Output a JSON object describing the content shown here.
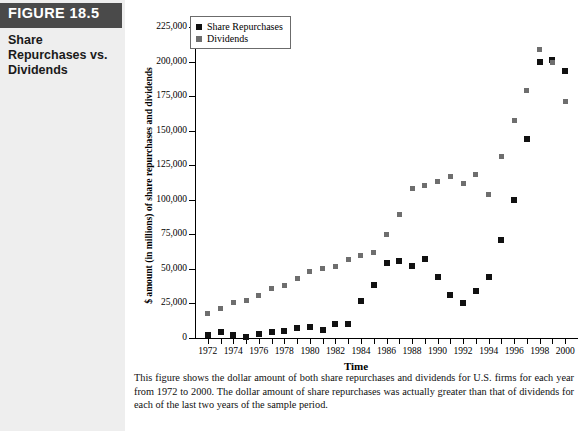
{
  "sidebar": {
    "figure_banner": "FIGURE 18.5",
    "figure_title": "Share Repurchases vs. Dividends"
  },
  "figure": {
    "caption": "This figure shows the dollar amount of both share repurchases and dividends for U.S. firms for each year from 1972 to 2000. The dollar amount of share repurchases was actually greater than that of dividends for each of the last two years of the sample period."
  },
  "colors": {
    "repurchases": "#111111",
    "dividends": "#6e6e6e",
    "banner_bg": "#4a4a4a",
    "sidebar_bg": "#eeeeee"
  },
  "chart_data": {
    "type": "scatter",
    "title": "",
    "xlabel": "Time",
    "ylabel": "$ amount (in millions) of share repurchases and dividends",
    "xlim": [
      1971,
      2001
    ],
    "ylim": [
      0,
      225000
    ],
    "grid": false,
    "legend_position": "top-left",
    "y_ticks": [
      0,
      25000,
      50000,
      75000,
      100000,
      125000,
      150000,
      175000,
      200000,
      225000
    ],
    "y_tick_labels": [
      "0",
      "25,000",
      "50,000",
      "75,000",
      "100,000",
      "125,000",
      "150,000",
      "175,000",
      "200,000",
      "225,000"
    ],
    "x_ticks": [
      1972,
      1973,
      1974,
      1975,
      1976,
      1977,
      1978,
      1979,
      1980,
      1981,
      1982,
      1983,
      1984,
      1985,
      1986,
      1987,
      1988,
      1989,
      1990,
      1991,
      1992,
      1993,
      1994,
      1995,
      1996,
      1997,
      1998,
      1999,
      2000
    ],
    "x_tick_labels": [
      "1972",
      "",
      "1974",
      "",
      "1976",
      "",
      "1978",
      "",
      "1980",
      "",
      "1982",
      "",
      "1984",
      "",
      "1986",
      "",
      "1988",
      "",
      "1990",
      "",
      "1992",
      "",
      "1994",
      "",
      "1996",
      "",
      "1998",
      "",
      "2000"
    ],
    "x": [
      1972,
      1973,
      1974,
      1975,
      1976,
      1977,
      1978,
      1979,
      1980,
      1981,
      1982,
      1983,
      1984,
      1985,
      1986,
      1987,
      1988,
      1989,
      1990,
      1991,
      1992,
      1993,
      1994,
      1995,
      1996,
      1997,
      1998,
      1999,
      2000
    ],
    "series": [
      {
        "name": "Share Repurchases",
        "color": "#111111",
        "marker": "square",
        "values": [
          2000,
          4000,
          2000,
          1000,
          3000,
          4000,
          5000,
          7000,
          8000,
          6000,
          10000,
          10000,
          27000,
          38000,
          54000,
          56000,
          52000,
          57000,
          44000,
          31000,
          25000,
          34000,
          44000,
          71000,
          100000,
          144000,
          200000,
          201000,
          193000
        ]
      },
      {
        "name": "Dividends",
        "color": "#6e6e6e",
        "marker": "square",
        "values": [
          18000,
          21000,
          26000,
          27000,
          31000,
          36000,
          38000,
          43000,
          48000,
          50000,
          52000,
          57000,
          60000,
          62000,
          75000,
          89000,
          108000,
          110000,
          113000,
          117000,
          112000,
          118000,
          104000,
          131000,
          157000,
          179000,
          209000,
          199000,
          171000
        ]
      }
    ]
  },
  "legend": {
    "items": [
      {
        "label": "Share Repurchases",
        "color": "#111111"
      },
      {
        "label": "Dividends",
        "color": "#6e6e6e"
      }
    ]
  }
}
